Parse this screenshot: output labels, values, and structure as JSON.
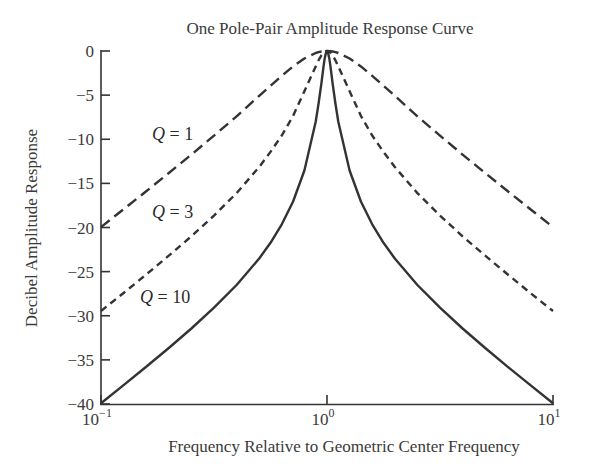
{
  "chart_data": {
    "type": "line",
    "title": "One Pole-Pair Amplitude Response Curve",
    "xlabel": "Frequency Relative to Geometric Center Frequency",
    "ylabel": "Decibel Amplitude Response",
    "xscale": "log",
    "xlim": [
      0.1,
      10
    ],
    "ylim": [
      -40,
      0
    ],
    "x_ticks": [
      {
        "value": 0.1,
        "base": "10",
        "exp": "−1"
      },
      {
        "value": 1,
        "base": "10",
        "exp": "0"
      },
      {
        "value": 10,
        "base": "10",
        "exp": "1"
      }
    ],
    "y_ticks": [
      0,
      -5,
      -10,
      -15,
      -20,
      -25,
      -30,
      -35,
      -40
    ],
    "y_tick_labels": [
      "0",
      "−5",
      "−10",
      "−15",
      "−20",
      "−25",
      "−30",
      "−35",
      "−40"
    ],
    "grid": false,
    "legend": "inline labels",
    "log10_x": [
      -1.0,
      -0.9,
      -0.8,
      -0.7,
      -0.6,
      -0.5,
      -0.4,
      -0.3,
      -0.25,
      -0.2,
      -0.15,
      -0.1,
      -0.05,
      -0.0375,
      -0.025,
      -0.015,
      -0.01,
      -0.005,
      0,
      0.005,
      0.01,
      0.015,
      0.025,
      0.0375,
      0.05,
      0.1,
      0.15,
      0.2,
      0.25,
      0.3,
      0.4,
      0.5,
      0.6,
      0.7,
      0.8,
      0.9,
      1.0
    ],
    "series": [
      {
        "name": "Q = 1",
        "label": "Q = 1",
        "style": "long-dash",
        "values": [
          -19.96,
          -17.93,
          -15.9,
          -13.83,
          -11.74,
          -9.59,
          -7.41,
          -5.08,
          -3.94,
          -2.81,
          -1.74,
          -0.85,
          -0.23,
          -0.13,
          -0.06,
          -0.02,
          -0.01,
          0.0,
          0,
          0.0,
          -0.01,
          -0.02,
          -0.06,
          -0.13,
          -0.23,
          -0.85,
          -1.74,
          -2.81,
          -3.94,
          -5.08,
          -7.41,
          -9.59,
          -11.74,
          -13.83,
          -15.9,
          -17.93,
          -19.96
        ],
        "label_pos": {
          "x": 152,
          "y": 140
        }
      },
      {
        "name": "Q = 3",
        "label": "Q = 3",
        "style": "short-dash",
        "values": [
          -29.46,
          -27.42,
          -25.33,
          -23.19,
          -21.0,
          -18.65,
          -16.1,
          -13.15,
          -11.43,
          -9.57,
          -7.34,
          -4.56,
          -1.74,
          -1.07,
          -0.49,
          -0.19,
          -0.08,
          -0.02,
          0,
          -0.02,
          -0.08,
          -0.19,
          -0.49,
          -1.07,
          -1.74,
          -4.56,
          -7.34,
          -9.57,
          -11.43,
          -13.15,
          -16.1,
          -18.65,
          -21.0,
          -23.19,
          -25.33,
          -27.42,
          -29.46
        ],
        "label_pos": {
          "x": 152,
          "y": 218
        }
      },
      {
        "name": "Q = 10",
        "label": "Q = 10",
        "style": "solid",
        "values": [
          -39.91,
          -37.86,
          -35.78,
          -33.65,
          -31.44,
          -29.09,
          -26.51,
          -23.51,
          -21.73,
          -19.64,
          -17.05,
          -13.54,
          -8.01,
          -6.01,
          -3.67,
          -1.69,
          -0.84,
          -0.22,
          0,
          -0.22,
          -0.84,
          -1.69,
          -3.67,
          -6.01,
          -8.01,
          -13.54,
          -17.05,
          -19.64,
          -21.73,
          -23.51,
          -26.51,
          -29.09,
          -31.44,
          -33.65,
          -35.78,
          -37.86,
          -39.91
        ],
        "label_pos": {
          "x": 140,
          "y": 303
        }
      }
    ]
  },
  "colors": {
    "line": "#333333",
    "text": "#3a3a3a",
    "background": "#ffffff"
  }
}
